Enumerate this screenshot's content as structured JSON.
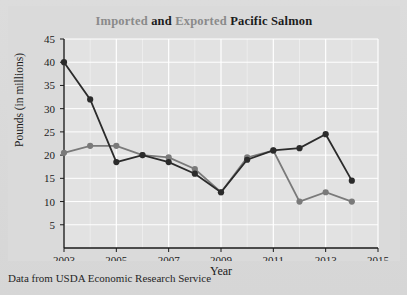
{
  "caption": "Data from USDA Economic Research Service",
  "title": {
    "part1": "Imported",
    "part2": " and ",
    "part3": "Exported",
    "part4": " Pacific Salmon",
    "full": "Imported and Exported Pacific Salmon"
  },
  "colors": {
    "imported_series": "#7a7a7a",
    "exported_series": "#2b2b2b",
    "plot_background": "#e2e2e2",
    "grid": "#ffffff",
    "axis": "#1a1a1a",
    "figure_background": "#d8d8d8",
    "title_muted": "#8a8a8a",
    "title_dark": "#1c1c1c"
  },
  "chart_data": {
    "type": "line",
    "title": "Imported and Exported Pacific Salmon",
    "xlabel": "Year",
    "ylabel": "Pounds (in millions)",
    "x": [
      2003,
      2004,
      2005,
      2006,
      2007,
      2008,
      2009,
      2010,
      2011,
      2012,
      2013,
      2014
    ],
    "xlim": [
      2003,
      2015
    ],
    "ylim": [
      0,
      45
    ],
    "yticks": [
      5,
      10,
      15,
      20,
      25,
      30,
      35,
      40,
      45
    ],
    "xticks": [
      2003,
      2005,
      2007,
      2009,
      2011,
      2013,
      2015
    ],
    "grid": true,
    "legend": "none",
    "series": [
      {
        "name": "Exported",
        "color": "#2b2b2b",
        "values": [
          40.0,
          32.0,
          18.5,
          20.0,
          18.5,
          16.0,
          12.0,
          19.0,
          21.0,
          21.5,
          24.5,
          14.5
        ]
      },
      {
        "name": "Imported",
        "color": "#7a7a7a",
        "values": [
          20.5,
          22.0,
          22.0,
          20.0,
          19.5,
          17.0,
          12.0,
          19.5,
          21.0,
          10.0,
          12.0,
          10.0
        ]
      }
    ]
  }
}
